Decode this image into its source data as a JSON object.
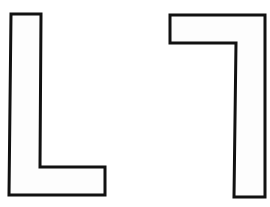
{
  "figure": {
    "background": "#ffffff",
    "stroke_color": "#111111",
    "fill_color": "#fdfdfd",
    "shapes": [
      {
        "name": "L-shape",
        "points": "11,14 41,14 40,167 105,167 105,195 9,195"
      },
      {
        "name": "mirrored-rotated-L-shape",
        "points": "170,15 265,15 265,197 234,197 236,43 170,43"
      }
    ]
  }
}
